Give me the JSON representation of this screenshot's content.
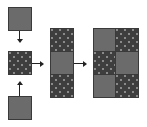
{
  "diagram": {
    "type": "block-assembly",
    "colors": {
      "plain_fill": "#6b6b6b",
      "dotted_fill": "#3e3e3e",
      "dot_color": "#8a8a8a",
      "arrow_color": "#222222",
      "background": "#ffffff"
    },
    "step1": {
      "pieces": [
        {
          "position": "top",
          "pattern": "plain"
        },
        {
          "position": "middle",
          "pattern": "dotted"
        },
        {
          "position": "bottom",
          "pattern": "plain"
        }
      ],
      "arrows": [
        "down",
        "up"
      ]
    },
    "step2": {
      "column": [
        "dotted",
        "plain",
        "dotted"
      ]
    },
    "step3": {
      "grid": [
        [
          "plain",
          "dotted"
        ],
        [
          "dotted",
          "plain"
        ],
        [
          "plain",
          "dotted"
        ]
      ]
    },
    "connectors": [
      "right",
      "right"
    ]
  }
}
